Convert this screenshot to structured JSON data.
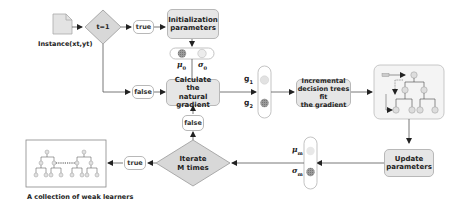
{
  "diagram": {
    "input": {
      "label": "Instance(xt,yt)",
      "icon": "document-icon"
    },
    "decision_start": {
      "label": "t=1"
    },
    "edges": {
      "true_top": "true",
      "false_left": "false",
      "false_up": "false",
      "true_bottom": "true"
    },
    "init_params": {
      "line1": "Initialization",
      "line2": "parameters"
    },
    "init_symbols": {
      "mu": "μ",
      "mu_sub": "0",
      "sigma": "σ",
      "sigma_sub": "0"
    },
    "calc_gradient": {
      "line1": "Calculate the",
      "line2": "natural gradient"
    },
    "gradients": {
      "g1": "g",
      "g1_sub": "1",
      "g2": "g",
      "g2_sub": "2"
    },
    "incremental": {
      "line1": "Incremental",
      "line2": "decision trees fit",
      "line3": "the gradient"
    },
    "update_params": {
      "line1": "Update",
      "line2": "parameters"
    },
    "m_symbols": {
      "mu": "μ",
      "mu_sub": "m",
      "sigma": "σ",
      "sigma_sub": "m"
    },
    "iterate": {
      "line1": "Iterate",
      "line2": "M times"
    },
    "weak_learners": {
      "caption": "A collection of weak learners"
    }
  },
  "colors": {
    "box_fill": "#e6e6e6",
    "box_border": "#b8b8b8",
    "line": "#555555",
    "dark_circle": "#8a8a8a",
    "light_circle": "#d8d8d8"
  }
}
